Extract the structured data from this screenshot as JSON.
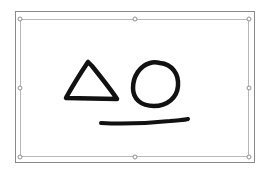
{
  "canvas": {
    "background": "#ffffff",
    "frame_color": "#8a8a8a",
    "selection_color": "#b8b8b8",
    "ink_color": "#111111"
  },
  "ink_drawing": {
    "shapes": [
      {
        "type": "triangle",
        "label": "triangle"
      },
      {
        "type": "circle",
        "label": "circle"
      },
      {
        "type": "line",
        "label": "underline"
      }
    ]
  },
  "selection_handles": [
    "top-left",
    "top-center",
    "top-right",
    "middle-left",
    "middle-right",
    "bottom-left",
    "bottom-center",
    "bottom-right"
  ]
}
